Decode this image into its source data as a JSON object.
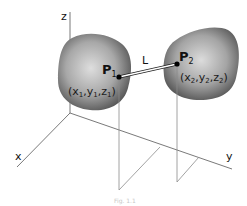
{
  "diagram": {
    "axes": {
      "x_label": "x",
      "y_label": "y",
      "z_label": "z"
    },
    "points": [
      {
        "name": "P",
        "subscript": "1",
        "coord_prefix": "(x",
        "coords": [
          "1",
          "1",
          "1"
        ]
      },
      {
        "name": "P",
        "subscript": "2",
        "coord_prefix": "(x",
        "coords": [
          "2",
          "2",
          "2"
        ]
      }
    ],
    "segment_label": "L",
    "coord_text": {
      "p1": {
        "open": "(x",
        "s1": "1",
        "y": ",y",
        "s2": "1",
        "z": ",z",
        "s3": "1",
        "close": ")"
      },
      "p2": {
        "open": "(x",
        "s1": "2",
        "y": ",y",
        "s2": "2",
        "z": ",z",
        "s3": "2",
        "close": ")"
      }
    },
    "caption": "Fig. 1.1",
    "colors": {
      "blob_light": "#d9d9d9",
      "blob_dark": "#4a4a4a",
      "axis": "#6a6a6a",
      "point": "#000000"
    }
  }
}
